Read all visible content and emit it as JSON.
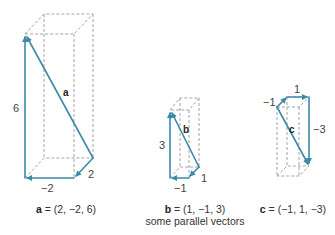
{
  "colors": {
    "vector": "#3a8aa8",
    "box": "#9a9a9a",
    "text": "#333333"
  },
  "vectors": [
    {
      "name": "a",
      "components": {
        "x": 2,
        "y": -2,
        "z": 6
      },
      "labels": {
        "x": "2",
        "y": "−2",
        "z": "6",
        "name": "a"
      },
      "caption": {
        "name": "a",
        "equation": " = (2, −2, 6)"
      }
    },
    {
      "name": "b",
      "components": {
        "x": 1,
        "y": -1,
        "z": 3
      },
      "labels": {
        "x": "1",
        "y": "−1",
        "z": "3",
        "name": "b"
      },
      "caption": {
        "name": "b",
        "equation": " = (1, −1, 3)"
      }
    },
    {
      "name": "c",
      "components": {
        "x": -1,
        "y": 1,
        "z": -3
      },
      "labels": {
        "x": "−1",
        "y": "1",
        "z": "−3",
        "name": "c"
      },
      "caption": {
        "name": "c",
        "equation": " = (−1, 1, −3)"
      }
    }
  ],
  "subcaption": "some parallel vectors"
}
